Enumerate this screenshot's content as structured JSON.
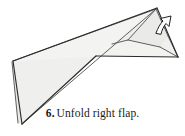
{
  "figure": {
    "kind": "origami-fold-diagram",
    "title": "Unfold right flap",
    "colors": {
      "paper_fill": "#f1f1ef",
      "paper_fill_shaded": "#e7e7e4",
      "paper_fill_light": "#f7f7f5",
      "outline": "#2b2b2b",
      "crease": "#4a4a4a",
      "arrow_fill": "#ffffff",
      "arrow_outline": "#1f1f1f",
      "background": "#ffffff",
      "text": "#1a1a1a"
    },
    "arrow": {
      "name": "unfold-arrow",
      "label": "unfold arrow pointing up-right"
    },
    "vertices": {
      "apex": "157,8",
      "right_tip": "178,57",
      "left_top": "13,61",
      "left_bottom": "22,124",
      "mid_junction": "128,40",
      "body_elbow": "96,56"
    }
  },
  "caption": {
    "step_number": "6.",
    "text": "Unfold right flap."
  }
}
